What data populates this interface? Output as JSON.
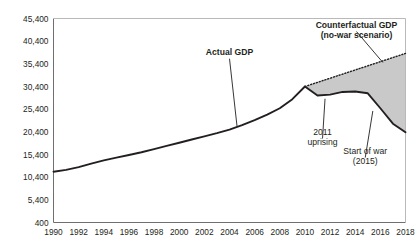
{
  "chart_data": {
    "type": "line",
    "title": "",
    "xlabel": "",
    "ylabel": "",
    "xlim": [
      1990,
      2018
    ],
    "ylim": [
      400,
      45400
    ],
    "grid": false,
    "legend": "none",
    "x_ticks": [
      "1990",
      "1992",
      "1994",
      "1996",
      "1998",
      "2000",
      "2002",
      "2004",
      "2006",
      "2008",
      "2010",
      "2012",
      "2014",
      "2016",
      "2018"
    ],
    "y_ticks": [
      "400",
      "5,400",
      "10,400",
      "15,400",
      "20,400",
      "25,400",
      "30,400",
      "35,400",
      "40,400",
      "45,400"
    ],
    "y_tick_values": [
      400,
      5400,
      10400,
      15400,
      20400,
      25400,
      30400,
      35400,
      40400,
      45400
    ],
    "series": [
      {
        "name": "Actual GDP",
        "style": "solid",
        "color": "#231f20",
        "x": [
          1990,
          1991,
          1992,
          1993,
          1994,
          1995,
          1996,
          1997,
          1998,
          1999,
          2000,
          2001,
          2002,
          2003,
          2004,
          2005,
          2006,
          2007,
          2008,
          2009,
          2010,
          2011,
          2012,
          2013,
          2014,
          2015,
          2016,
          2017,
          2018
        ],
        "values": [
          11600,
          12000,
          12600,
          13400,
          14100,
          14700,
          15300,
          15900,
          16600,
          17300,
          18000,
          18700,
          19400,
          20100,
          20900,
          21900,
          23000,
          24200,
          25600,
          27600,
          30400,
          28400,
          28600,
          29200,
          29300,
          28900,
          25600,
          22200,
          20300
        ]
      },
      {
        "name": "Counterfactual GDP (no-war scenario)",
        "style": "dotted",
        "color": "#231f20",
        "x": [
          2010,
          2018
        ],
        "values": [
          30400,
          37700
        ]
      }
    ],
    "shaded_region": {
      "label": "gap between counterfactual and actual GDP",
      "color": "#c9c9c9",
      "x_start": 2010,
      "x_end": 2018
    },
    "annotations": [
      {
        "id": "actual-gdp",
        "text": "Actual GDP",
        "bold": true,
        "x": 2004.0,
        "y": 37300,
        "leader_to_x": 2004.6,
        "leader_to_y": 21600
      },
      {
        "id": "counterfactual-l1",
        "text": "Counterfactual GDP",
        "bold": true,
        "x": 2014.1,
        "y": 43300,
        "leader_to_x": 2016.2,
        "leader_to_y": 35700
      },
      {
        "id": "counterfactual-l2",
        "text": "(no-war scenario)",
        "bold": true,
        "x": 2014.1,
        "y": 41100,
        "leader_to_x": null,
        "leader_to_y": null
      },
      {
        "id": "uprising-l1",
        "text": "2011",
        "bold": false,
        "x": 2011.4,
        "y": 19700,
        "leader_to_x": 2011.6,
        "leader_to_y": 27700
      },
      {
        "id": "uprising-l2",
        "text": "uprising",
        "bold": false,
        "x": 2011.4,
        "y": 17600,
        "leader_to_x": null,
        "leader_to_y": null
      },
      {
        "id": "startwar-l1",
        "text": "Start of war",
        "bold": false,
        "x": 2014.8,
        "y": 15500,
        "leader_to_x": 2015.4,
        "leader_to_y": 25000
      },
      {
        "id": "startwar-l2",
        "text": "(2015)",
        "bold": false,
        "x": 2014.8,
        "y": 13400,
        "leader_to_x": null,
        "leader_to_y": null
      }
    ],
    "axis_color": "#6f6f6f"
  }
}
